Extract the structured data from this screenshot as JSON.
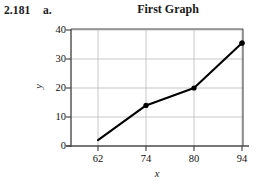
{
  "problem": {
    "number": "2.181",
    "part": "a."
  },
  "chart_data": {
    "type": "line",
    "title": "First Graph",
    "xlabel": "x",
    "ylabel": "y",
    "categories": [
      "62",
      "74",
      "80",
      "94"
    ],
    "x": [
      62,
      74,
      80,
      94
    ],
    "values": [
      2,
      14,
      20,
      35.5
    ],
    "series": [
      {
        "name": "First Graph",
        "values": [
          2,
          14,
          20,
          35.5
        ]
      }
    ],
    "ylim": [
      0,
      40
    ],
    "yticks": [
      "0",
      "10",
      "20",
      "30",
      "40"
    ],
    "ytick_values": [
      0,
      10,
      20,
      30,
      40
    ],
    "xticks": [
      "62",
      "74",
      "80",
      "94"
    ],
    "grid": true,
    "legend": "none",
    "marker": "filled-circle",
    "line_color": "#000000",
    "marker_color": "#000000",
    "grid_color": "#b5b5b5",
    "axis_color": "#4a4a4a"
  }
}
